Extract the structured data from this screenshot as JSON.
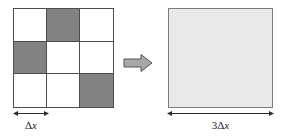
{
  "figure": {
    "type": "schematic-diagram",
    "colors": {
      "shaded_cell": "#828282",
      "empty_cell": "#ffffff",
      "grid_line": "#4d4d4d",
      "big_square_fill": "#e9e9e9",
      "big_square_border": "#7d7d7d",
      "arrow_fill": "#a8a8a8",
      "arrow_stroke": "#555555",
      "dimension_line": "#2b2b2b",
      "text": "#1a1a1a",
      "background": "#ffffff"
    }
  },
  "left_panel": {
    "name": "fine-grid",
    "rows": 3,
    "columns": 3,
    "cells": [
      [
        {
          "row": 1,
          "col": 1,
          "shaded": false
        },
        {
          "row": 1,
          "col": 2,
          "shaded": true
        },
        {
          "row": 1,
          "col": 3,
          "shaded": false
        }
      ],
      [
        {
          "row": 2,
          "col": 1,
          "shaded": true
        },
        {
          "row": 2,
          "col": 2,
          "shaded": false
        },
        {
          "row": 2,
          "col": 3,
          "shaded": false
        }
      ],
      [
        {
          "row": 3,
          "col": 1,
          "shaded": false
        },
        {
          "row": 3,
          "col": 2,
          "shaded": false
        },
        {
          "row": 3,
          "col": 3,
          "shaded": true
        }
      ]
    ],
    "shaded_count": 3,
    "total_count": 9,
    "dimension": {
      "label_prefix": "",
      "label_delta": "Δ",
      "label_var": "x",
      "label_full": "Δx",
      "spans": "one cell width"
    }
  },
  "arrow": {
    "name": "transform-arrow",
    "direction": "right",
    "glyph": "block-arrow-right"
  },
  "right_panel": {
    "name": "coarse-square",
    "fill": "uniform-light-gray",
    "dimension": {
      "label_prefix": "3",
      "label_delta": "Δ",
      "label_var": "x",
      "label_full": "3Δx",
      "spans": "three cell widths"
    }
  }
}
